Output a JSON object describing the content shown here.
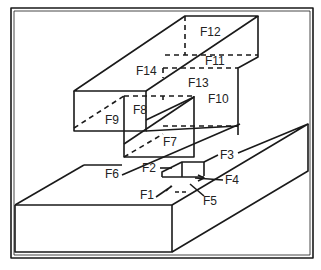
{
  "diagram": {
    "type": "isometric-feature-diagram",
    "labels": {
      "F1": "F1",
      "F2": "F2",
      "F3": "F3",
      "F4": "F4",
      "F5": "F5",
      "F6": "F6",
      "F7": "F7",
      "F8": "F8",
      "F9": "F9",
      "F10": "F10",
      "F11": "F11",
      "F12": "F12",
      "F13": "F13",
      "F14": "F14"
    },
    "colors": {
      "stroke": "#1a1a1a",
      "background": "#ffffff"
    }
  }
}
